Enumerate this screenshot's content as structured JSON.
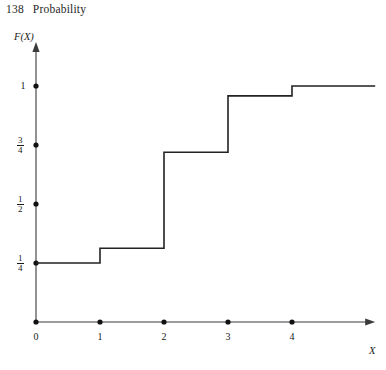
{
  "page": {
    "folio": "138",
    "running_head": "Probability"
  },
  "figure": {
    "y_axis_label": "F(X)",
    "x_axis_label": "X",
    "caption_fragment": ""
  },
  "chart_data": {
    "type": "line",
    "title": "",
    "xlabel": "X",
    "ylabel": "F(X)",
    "style": "step-function cumulative distribution function",
    "xlim": [
      0,
      5.3
    ],
    "ylim": [
      0,
      1.12
    ],
    "xticks": [
      0,
      1,
      2,
      3,
      4
    ],
    "xtick_labels": [
      "0",
      "1",
      "2",
      "3",
      "4"
    ],
    "yticks": [
      0.25,
      0.5,
      0.75,
      1
    ],
    "ytick_labels": [
      "1/4",
      "1/2",
      "3/4",
      "1"
    ],
    "ytick_numerators": [
      "1",
      "1",
      "3",
      "1"
    ],
    "ytick_denominators": [
      "4",
      "2",
      "4",
      ""
    ],
    "grid": false,
    "legend": null,
    "steps": [
      {
        "x_start": 0,
        "x_end": 1,
        "y": 0.25
      },
      {
        "x_start": 1,
        "x_end": 2,
        "y": 0.3125
      },
      {
        "x_start": 2,
        "x_end": 3,
        "y": 0.719
      },
      {
        "x_start": 3,
        "x_end": 4,
        "y": 0.958
      },
      {
        "x_start": 4,
        "x_end": 5.3,
        "y": 1.0
      }
    ],
    "x_axis_dots": [
      0,
      1,
      2,
      3,
      4
    ],
    "y_axis_dots": [
      0.25,
      0.5,
      0.75,
      1.0
    ],
    "line_color": "#222222",
    "axis_color": "#3a3a3a"
  }
}
